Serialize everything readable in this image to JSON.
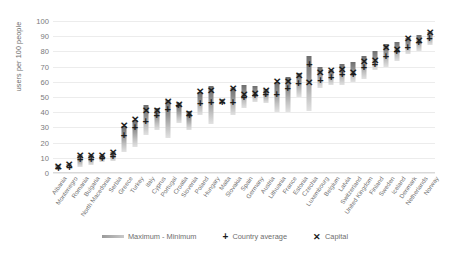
{
  "chart_data": {
    "type": "bar",
    "title": "",
    "xlabel": "",
    "ylabel": "users per 100 people",
    "ylim": [
      0,
      100
    ],
    "yticks": [
      0,
      10,
      20,
      30,
      40,
      50,
      60,
      70,
      80,
      90,
      100
    ],
    "grid": true,
    "legend_position": "bottom",
    "categories": [
      "Albania",
      "Montenegro",
      "Romania",
      "Bulgaria",
      "North Macedonia",
      "Serbia",
      "Greece",
      "Turkey",
      "Italy",
      "Cyprus",
      "Portugal",
      "Croatia",
      "Slovenia",
      "Poland",
      "Hungary",
      "Malta",
      "Slovakia",
      "Spain",
      "Germany",
      "Austria",
      "Lithuania",
      "France",
      "Estonia",
      "Czechia",
      "Luxembourg",
      "Belgium",
      "Latvia",
      "Switzerland",
      "United Kingdom",
      "Finland",
      "Sweden",
      "Iceland",
      "Denmark",
      "Netherlands",
      "Norway"
    ],
    "series": [
      {
        "name": "Maximum - Minimum",
        "type": "range",
        "min": [
          2,
          3,
          4,
          5,
          7,
          8,
          14,
          17,
          25,
          28,
          23,
          33,
          28,
          38,
          32,
          46,
          38,
          43,
          47,
          46,
          40,
          40,
          50,
          41,
          56,
          58,
          58,
          60,
          62,
          68,
          70,
          74,
          78,
          80,
          84
        ],
        "max": [
          5,
          6,
          12,
          12,
          12,
          14,
          31,
          35,
          45,
          43,
          48,
          46,
          41,
          53,
          57,
          48,
          56,
          58,
          57,
          55,
          60,
          63,
          66,
          77,
          70,
          68,
          72,
          73,
          77,
          80,
          85,
          86,
          89,
          91,
          93
        ]
      },
      {
        "name": "Country average",
        "type": "marker",
        "values": [
          3,
          4,
          9,
          9,
          10,
          11,
          25,
          30,
          34,
          38,
          42,
          45,
          38,
          46,
          47,
          47,
          47,
          50,
          51,
          52,
          52,
          56,
          59,
          72,
          61,
          63,
          65,
          65,
          70,
          72,
          77,
          80,
          83,
          86,
          89
        ]
      },
      {
        "name": "Capital",
        "type": "marker",
        "values": [
          4,
          5,
          11,
          11,
          11,
          13,
          31,
          35,
          41,
          41,
          47,
          45,
          39,
          53,
          54,
          47,
          55,
          51,
          52,
          54,
          60,
          60,
          64,
          59,
          66,
          67,
          68,
          66,
          73,
          74,
          82,
          81,
          88,
          87,
          92
        ]
      }
    ]
  },
  "legend": {
    "range_label": "Maximum - Minimum",
    "average_label": "Country average",
    "capital_label": "Capital",
    "average_glyph": "+",
    "capital_glyph": "✕"
  },
  "markers": {
    "average_glyph": "+",
    "capital_glyph": "✕"
  },
  "colors": {
    "marker": "#1c1c1c",
    "bar_top": "#6e6e6e",
    "bar_bottom": "#e2e2e2",
    "grid": "#ececec",
    "text": "#6d6d6d"
  }
}
